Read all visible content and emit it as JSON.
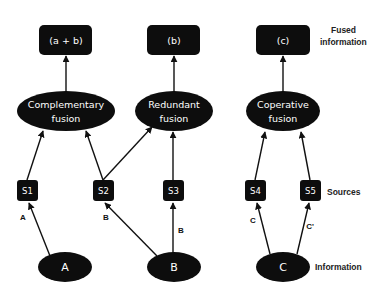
{
  "diagram": {
    "type": "information-fusion-taxonomy",
    "fused_outputs": [
      {
        "id": "out1",
        "label": "(a + b)"
      },
      {
        "id": "out2",
        "label": "(b)"
      },
      {
        "id": "out3",
        "label": "(c)"
      }
    ],
    "fusion_nodes": [
      {
        "id": "f1",
        "line1": "Complementary",
        "line2": "fusion"
      },
      {
        "id": "f2",
        "line1": "Redundant",
        "line2": "fusion"
      },
      {
        "id": "f3",
        "line1": "Coperative",
        "line2": "fusion"
      }
    ],
    "sources": [
      {
        "id": "s1",
        "label": "S1"
      },
      {
        "id": "s2",
        "label": "S2"
      },
      {
        "id": "s3",
        "label": "S3"
      },
      {
        "id": "s4",
        "label": "S4"
      },
      {
        "id": "s5",
        "label": "S5"
      }
    ],
    "information_nodes": [
      {
        "id": "a",
        "label": "A"
      },
      {
        "id": "b",
        "label": "B"
      },
      {
        "id": "c",
        "label": "C"
      }
    ],
    "edge_labels": {
      "a_to_s1": "A",
      "b_to_s2": "B",
      "b_to_s3": "B",
      "c_to_s4": "C",
      "c_to_s5": "C'"
    },
    "row_labels": {
      "fused_line1": "Fused",
      "fused_line2": "information",
      "sources": "Sources",
      "information": "Information"
    },
    "edges": [
      {
        "from": "a",
        "to": "s1"
      },
      {
        "from": "b",
        "to": "s2"
      },
      {
        "from": "b",
        "to": "s3"
      },
      {
        "from": "c",
        "to": "s4"
      },
      {
        "from": "c",
        "to": "s5"
      },
      {
        "from": "s1",
        "to": "f1"
      },
      {
        "from": "s2",
        "to": "f1"
      },
      {
        "from": "s2",
        "to": "f2"
      },
      {
        "from": "s3",
        "to": "f2"
      },
      {
        "from": "s4",
        "to": "f3"
      },
      {
        "from": "s5",
        "to": "f3"
      },
      {
        "from": "f1",
        "to": "out1"
      },
      {
        "from": "f2",
        "to": "out2"
      },
      {
        "from": "f3",
        "to": "out3"
      }
    ]
  }
}
